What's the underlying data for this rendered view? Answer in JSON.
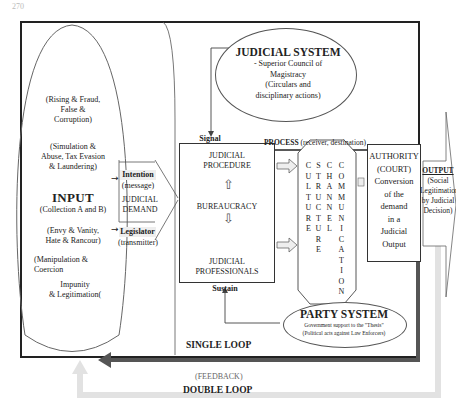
{
  "page_number": "270",
  "input": {
    "title": "INPUT",
    "items": [
      "(Rising & Fraud,",
      "False &",
      "Corruption)",
      "(Simulation &",
      "Abuse, Tax Evasion",
      "& Laundering)",
      "(Collection A and B)",
      "(Envy & Vanity,",
      "Hate & Rancour)",
      "(Manipulation &",
      "Coercion",
      "Impunity",
      "& Legitimation("
    ]
  },
  "demand": {
    "intention": "Intention",
    "message": "(message)",
    "judicial_demand_line1": "JUDICIAL",
    "judicial_demand_line2": "DEMAND",
    "legislator": "Legislator",
    "transmitter": "(transmitter)"
  },
  "judicial_system": {
    "title": "JUDICIAL SYSTEM",
    "lines": [
      "- Superior Council of",
      "Magistracy",
      "(Circulars and",
      "disciplinary actions)"
    ]
  },
  "signal_label": "Signal",
  "sustain_label": "Sustain",
  "bureaucracy_box": {
    "procedure_1": "JUDICIAL",
    "procedure_2": "PROCEDURE",
    "bureaucracy": "BUREAUCRACY",
    "professionals_1": "JUDICIAL",
    "professionals_2": "PROFESSIONALS"
  },
  "process": {
    "label_bold": "PROCESS",
    "label_rest": " (receiver, destination)",
    "columns": [
      "CULTURE",
      "STRUCTURE",
      "CHANNEL",
      "COMMUNICATION"
    ]
  },
  "authority": {
    "lines": [
      "AUTHORITY",
      "(COURT)",
      "Conversion",
      "of the",
      "demand",
      "in a",
      "Judicial",
      "Output"
    ]
  },
  "output": {
    "title": "OUTPUT",
    "lines": [
      "(Social",
      "Legitimation",
      "by Judicial",
      "Decision)"
    ]
  },
  "party_system": {
    "title": "PARTY SYSTEM",
    "line1": "Government support to the \"Thesis\"",
    "line2": "(Political acts against Law Enforcers)"
  },
  "loops": {
    "single": "SINGLE LOOP",
    "feedback": "(FEEDBACK)",
    "double": "DOUBLE LOOP"
  },
  "colors": {
    "line": "#222222",
    "single_loop": "#555555",
    "double_loop": "#dddddd"
  }
}
